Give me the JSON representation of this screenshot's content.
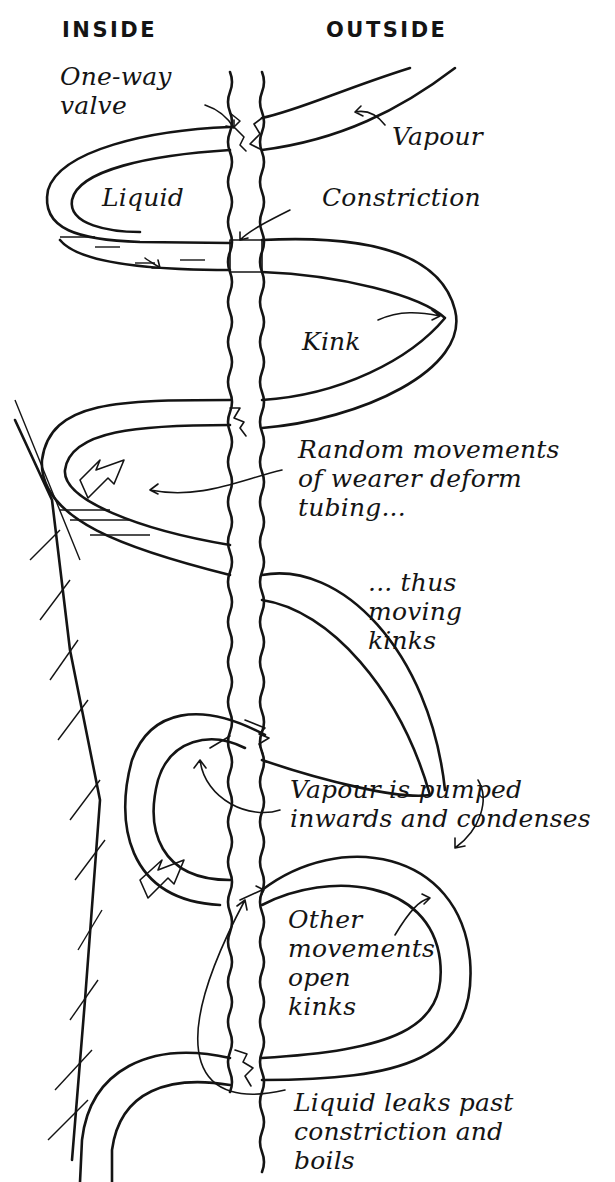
{
  "diagram": {
    "columns": {
      "inside": "INSIDE",
      "outside": "OUTSIDE"
    },
    "labels": {
      "one_way_valve": "One-way\nvalve",
      "vapour": "Vapour",
      "liquid": "Liquid",
      "constriction": "Constriction",
      "kink": "Kink",
      "random_movements": "Random movements\nof wearer deform\ntubing...",
      "thus_moving_kinks": "... thus\n     moving\n     kinks",
      "vapour_pumped": "Vapour is pumped\ninwards and condenses",
      "other_movements": "Other\nmovements\nopen\nkinks",
      "liquid_leaks": "Liquid leaks past\nconstriction and\nboils"
    },
    "ink_color": "#141414",
    "background_color": "#ffffff"
  }
}
